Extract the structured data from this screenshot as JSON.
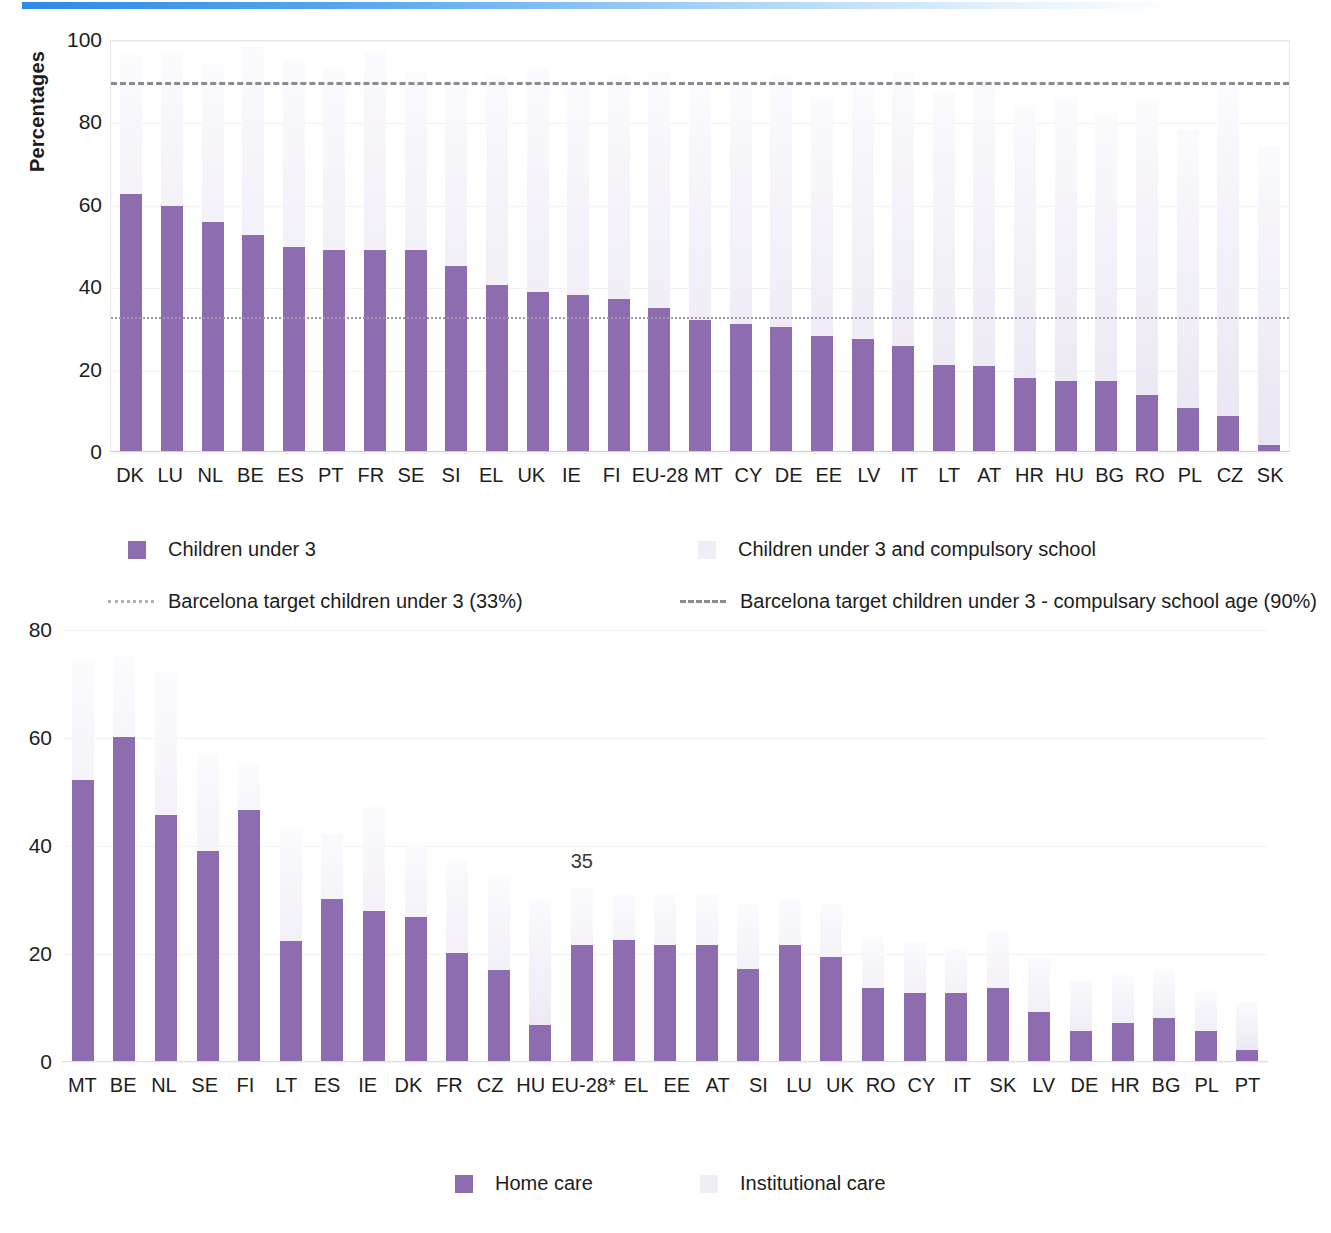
{
  "decor": {
    "top_rule_color": "#2e8ae6"
  },
  "colors": {
    "bar_dark": "#8d6caf",
    "bar_light": "#f1edf7",
    "target33_line": "#9f96ad",
    "target90_line": "#8d8a93"
  },
  "chart_data": [
    {
      "type": "bar",
      "id": "childcare-coverage",
      "title": "",
      "xlabel": "",
      "ylabel": "Percentages",
      "ylim": [
        0,
        100
      ],
      "yticks": [
        0,
        20,
        40,
        60,
        80,
        100
      ],
      "grid": true,
      "legend_position": "below",
      "categories": [
        "DK",
        "LU",
        "NL",
        "BE",
        "ES",
        "PT",
        "FR",
        "SE",
        "SI",
        "EL",
        "UK",
        "IE",
        "FI",
        "EU-28",
        "MT",
        "CY",
        "DE",
        "EE",
        "LV",
        "IT",
        "LT",
        "AT",
        "HR",
        "HU",
        "BG",
        "RO",
        "PL",
        "CZ",
        "SK"
      ],
      "series": [
        {
          "name": "Children under 3",
          "color": "#8d6caf",
          "values": [
            62.5,
            59.5,
            55.5,
            52.5,
            49.5,
            48.8,
            48.8,
            48.8,
            45.0,
            40.3,
            38.5,
            37.8,
            36.8,
            34.6,
            31.8,
            30.8,
            30.0,
            28.0,
            27.2,
            25.6,
            20.8,
            20.7,
            17.8,
            17.0,
            16.9,
            13.5,
            10.4,
            8.5,
            1.4
          ]
        },
        {
          "name": "Children under 3 and compulsory school",
          "color": "#f1edf7",
          "values": [
            96,
            97,
            94,
            98,
            95,
            93,
            97,
            92,
            90,
            91,
            93,
            90,
            91,
            92,
            88,
            90,
            91,
            86,
            88,
            92,
            87,
            90,
            84,
            86,
            82,
            85,
            78,
            88,
            74
          ]
        }
      ],
      "reference_lines": [
        {
          "label": "Barcelona target children under 3 (33%)",
          "value": 33,
          "style": "dotted",
          "color": "#9f96ad"
        },
        {
          "label": "Barcelona target children under 3 - compulsary school age (90%)",
          "value": 90,
          "style": "dashed",
          "color": "#8d8a93"
        }
      ],
      "legend": [
        {
          "label": "Children under 3",
          "marker": "square",
          "color": "#8d6caf"
        },
        {
          "label": "Children under 3 and compulsory school",
          "marker": "square",
          "color": "#f1edf7"
        },
        {
          "label": "Barcelona target children under 3 (33%)",
          "marker": "dotted-line",
          "color": "#b3acbe"
        },
        {
          "label": "Barcelona target children under 3 - compulsary school age (90%)",
          "marker": "dashed-line",
          "color": "#8d8a93"
        }
      ]
    },
    {
      "type": "bar",
      "id": "long-term-care",
      "title": "",
      "xlabel": "",
      "ylabel": "",
      "ylim": [
        0,
        80
      ],
      "yticks": [
        0,
        20,
        40,
        60,
        80
      ],
      "grid": true,
      "legend_position": "below",
      "categories": [
        "MT",
        "BE",
        "NL",
        "SE",
        "FI",
        "LT",
        "ES",
        "IE",
        "DK",
        "FR",
        "CZ",
        "HU",
        "EU-28*",
        "EL",
        "EE",
        "AT",
        "SI",
        "LU",
        "UK",
        "RO",
        "CY",
        "IT",
        "SK",
        "LV",
        "DE",
        "HR",
        "BG",
        "PL",
        "PT"
      ],
      "series": [
        {
          "name": "Home care",
          "color": "#8d6caf",
          "values": [
            52.0,
            60.0,
            45.5,
            38.8,
            46.5,
            22.2,
            30.0,
            27.8,
            26.7,
            20.0,
            16.8,
            6.6,
            21.4,
            22.4,
            21.4,
            21.4,
            17.0,
            21.5,
            19.2,
            13.5,
            12.6,
            12.6,
            13.6,
            9.0,
            5.5,
            7.0,
            8.0,
            5.6,
            2.0
          ]
        },
        {
          "name": "Institutional care",
          "color": "#f1edf7",
          "values": [
            74.0,
            75.0,
            72.0,
            57.0,
            55.0,
            43.0,
            42.0,
            47.0,
            40.0,
            37.0,
            34.0,
            30.0,
            32.0,
            31.0,
            31.0,
            31.0,
            29.0,
            30.0,
            29.0,
            23.0,
            22.0,
            21.0,
            24.0,
            19.0,
            15.0,
            16.0,
            17.0,
            13.0,
            11.0
          ]
        }
      ],
      "annotations": [
        {
          "text": "35",
          "x_category": "EU-28*",
          "y": 35
        }
      ],
      "legend": [
        {
          "label": "Home care",
          "marker": "square",
          "color": "#8d6caf"
        },
        {
          "label": "Institutional care",
          "marker": "square",
          "color": "#f1edf7"
        }
      ]
    }
  ]
}
